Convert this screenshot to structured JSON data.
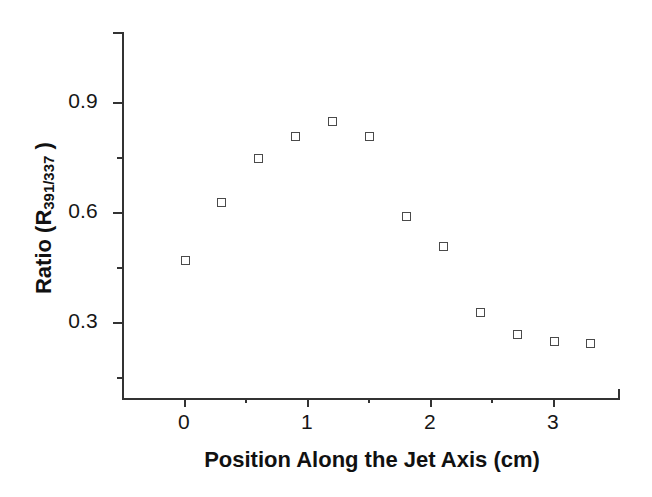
{
  "chart_data": {
    "type": "scatter",
    "title": "",
    "xlabel": "Position Along the Jet Axis (cm)",
    "ylabel_prefix": "Ratio (R",
    "ylabel_sub": "391/337",
    "ylabel_suffix": " )",
    "ylabel_plain": "Ratio (R391/337 )",
    "x": [
      0,
      0.3,
      0.6,
      0.9,
      1.2,
      1.5,
      1.8,
      2.1,
      2.4,
      2.7,
      3.0,
      3.3
    ],
    "values": [
      0.47,
      0.63,
      0.75,
      0.81,
      0.85,
      0.81,
      0.59,
      0.51,
      0.33,
      0.27,
      0.25,
      0.245
    ],
    "series": [
      {
        "name": "R391/337",
        "marker": "open-square",
        "marker_color": "#4a4a4a",
        "points": [
          {
            "x": 0.0,
            "y": 0.47
          },
          {
            "x": 0.3,
            "y": 0.63
          },
          {
            "x": 0.6,
            "y": 0.75
          },
          {
            "x": 0.9,
            "y": 0.81
          },
          {
            "x": 1.2,
            "y": 0.85
          },
          {
            "x": 1.5,
            "y": 0.81
          },
          {
            "x": 1.8,
            "y": 0.59
          },
          {
            "x": 2.1,
            "y": 0.51
          },
          {
            "x": 2.4,
            "y": 0.33
          },
          {
            "x": 2.7,
            "y": 0.27
          },
          {
            "x": 3.0,
            "y": 0.25
          },
          {
            "x": 3.3,
            "y": 0.245
          }
        ]
      }
    ],
    "xlim": [
      -0.5,
      3.55
    ],
    "ylim": [
      0.03,
      1.0
    ],
    "xticks": [
      0,
      1,
      2,
      3
    ],
    "xtick_labels": [
      "0",
      "1",
      "2",
      "3"
    ],
    "xticks_minor": [
      0.5,
      1.5,
      2.5,
      3.5
    ],
    "yticks": [
      0.3,
      0.6,
      0.9
    ],
    "ytick_labels": [
      "0.3",
      "0.6",
      "0.9"
    ],
    "yticks_minor": [
      0.15,
      0.45,
      0.75,
      1.0
    ],
    "grid": false,
    "legend": false,
    "legend_position": "none",
    "axis_color": "#333333",
    "background": "#ffffff"
  }
}
